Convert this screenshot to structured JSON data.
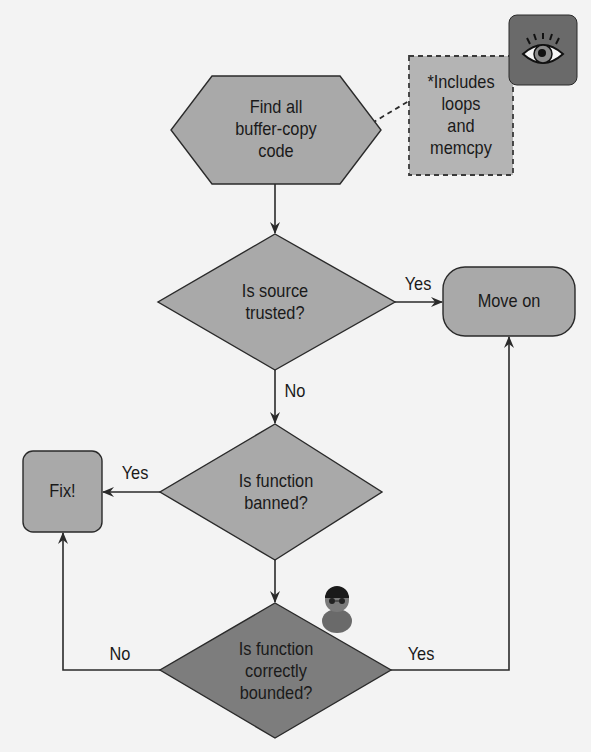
{
  "diagram": {
    "type": "flowchart",
    "colors": {
      "background": "#f3f3f3",
      "node_fill": "#a9a9a9",
      "node_fill_dark": "#7d7d7d",
      "note_fill": "#b4b4b4",
      "stroke": "#2a2a2a",
      "icon_box": "#6a6a6a"
    },
    "nodes": {
      "start": {
        "shape": "hexagon",
        "lines": [
          "Find all",
          "buffer-copy",
          "code"
        ]
      },
      "note": {
        "shape": "dashed-rectangle",
        "lines": [
          "*Includes",
          "loops",
          "and",
          "memcpy"
        ]
      },
      "q_trusted": {
        "shape": "diamond",
        "lines": [
          "Is source",
          "trusted?"
        ]
      },
      "move_on": {
        "shape": "rounded-rectangle",
        "label": "Move on"
      },
      "q_banned": {
        "shape": "diamond",
        "lines": [
          "Is function",
          "banned?"
        ]
      },
      "fix": {
        "shape": "rounded-rectangle",
        "label": "Fix!"
      },
      "q_bounded": {
        "shape": "diamond",
        "lines": [
          "Is function",
          "correctly",
          "bounded?"
        ]
      }
    },
    "edges": {
      "trusted_yes": "Yes",
      "trusted_no": "No",
      "banned_yes": "Yes",
      "bounded_no": "No",
      "bounded_yes": "Yes"
    },
    "icons": {
      "eye": "eye-icon",
      "person": "hacker-person-icon"
    }
  }
}
